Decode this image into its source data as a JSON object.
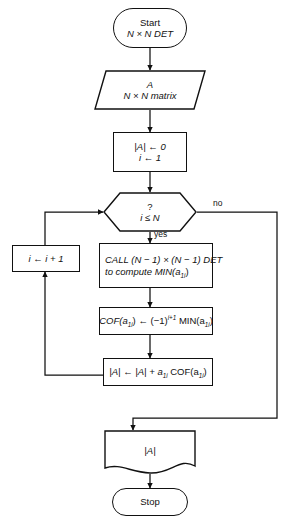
{
  "diagram": {
    "background_color": "#ffffff",
    "stroke_color": "#111111"
  },
  "nodes": {
    "start": {
      "kind": "terminal",
      "line1": "Start",
      "line2": "N × N DET"
    },
    "input_matrix": {
      "kind": "input-output",
      "line1": "A",
      "line2": "N × N matrix"
    },
    "init": {
      "kind": "process",
      "line1": "|A| ← 0",
      "line2": "i ← 1"
    },
    "decision": {
      "kind": "decision",
      "line1": "?",
      "line2": "i ≤ N",
      "yes_label": "yes",
      "no_label": "no"
    },
    "increment": {
      "kind": "process",
      "line1": "i ← i + 1"
    },
    "call_det": {
      "kind": "process",
      "line1": "CALL (N − 1) × (N − 1) DET",
      "line2": "to compute MIN(a",
      "line2_sub": "1i",
      "line2_tail": ")"
    },
    "cofactor": {
      "kind": "process",
      "text_a": "COF(a",
      "sub_a": "1i",
      "text_b": ") ← (−1)",
      "sup_b": "i+1",
      "text_c": " MIN(a",
      "sub_c": "1i",
      "text_d": ")"
    },
    "accumulate": {
      "kind": "process",
      "text_a": "|A| ← |A| + a",
      "sub_a": "1i",
      "text_b": " COF(a",
      "sub_b": "1i",
      "text_c": ")"
    },
    "output_det": {
      "kind": "document",
      "line1": "|A|"
    },
    "stop": {
      "kind": "terminal",
      "line1": "Stop"
    }
  }
}
